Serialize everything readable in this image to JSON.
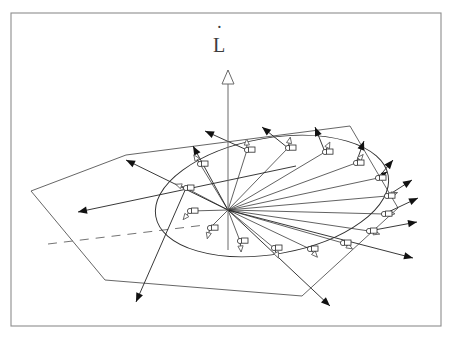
{
  "figure": {
    "title_label": "L̇",
    "axis_label_letter": "L",
    "axis_label_dot": "˙",
    "axis_name": "angular-momentum-rate-axis",
    "background_color": "#ffffff",
    "line_color": "#2f2f2f",
    "frame_color": "#8d8d8d",
    "arrow_fill_color": "#111111",
    "apex": {
      "x": 228,
      "y": 210
    },
    "frame": {
      "x": 11,
      "y": 13,
      "width": 430,
      "height": 313
    },
    "vertical_axis": {
      "x": 228,
      "y_top": 70,
      "y_bottom": 250
    },
    "plane": {
      "name": "tilted-reference-plane",
      "points": "31,191 126,155 350,126 398,208 302,296 105,280",
      "dash_from": {
        "x": 48,
        "y": 244
      },
      "dash_to": {
        "x": 205,
        "y": 225
      }
    },
    "cone_base_ellipse": {
      "center": {
        "x": 272,
        "y": 196
      },
      "rx": 118,
      "ry": 58,
      "rotation_deg": -10
    },
    "node_count": 16,
    "nodes": [
      {
        "id": 1,
        "x": 247,
        "y": 150,
        "ang": 92,
        "tip": "open"
      },
      {
        "id": 2,
        "x": 288,
        "y": 148,
        "ang": 78,
        "tip": "open"
      },
      {
        "id": 3,
        "x": 325,
        "y": 152,
        "ang": 64,
        "tip": "open"
      },
      {
        "id": 4,
        "x": 356,
        "y": 163,
        "ang": 50,
        "tip": "open"
      },
      {
        "id": 5,
        "x": 378,
        "y": 178,
        "ang": 34,
        "tip": "filled"
      },
      {
        "id": 6,
        "x": 387,
        "y": 196,
        "ang": 18,
        "tip": "open"
      },
      {
        "id": 7,
        "x": 384,
        "y": 214,
        "ang": 2,
        "tip": "open"
      },
      {
        "id": 8,
        "x": 369,
        "y": 231,
        "ang": -16,
        "tip": "open"
      },
      {
        "id": 9,
        "x": 343,
        "y": 243,
        "ang": -32,
        "tip": "open"
      },
      {
        "id": 10,
        "x": 310,
        "y": 249,
        "ang": -48,
        "tip": "open"
      },
      {
        "id": 11,
        "x": 274,
        "y": 248,
        "ang": -66,
        "tip": "open"
      },
      {
        "id": 12,
        "x": 240,
        "y": 241,
        "ang": -84,
        "tip": "open"
      },
      {
        "id": 13,
        "x": 210,
        "y": 228,
        "ang": -104,
        "tip": "open"
      },
      {
        "id": 14,
        "x": 190,
        "y": 211,
        "ang": -128,
        "tip": "open"
      },
      {
        "id": 15,
        "x": 186,
        "y": 188,
        "ang": 160,
        "tip": "open"
      },
      {
        "id": 16,
        "x": 200,
        "y": 164,
        "ang": 124,
        "tip": "open"
      }
    ],
    "outer_vectors": [
      {
        "name": "vector-up-left-long",
        "x1": 228,
        "y1": 210,
        "x2": 126,
        "y2": 160
      },
      {
        "name": "vector-upper-left",
        "x1": 228,
        "y1": 210,
        "x2": 193,
        "y2": 146
      },
      {
        "name": "vector-top-a",
        "x1": 247,
        "y1": 150,
        "x2": 205,
        "y2": 131
      },
      {
        "name": "vector-top-b",
        "x1": 288,
        "y1": 148,
        "x2": 262,
        "y2": 127
      },
      {
        "name": "vector-top-c",
        "x1": 325,
        "y1": 152,
        "x2": 315,
        "y2": 127
      },
      {
        "name": "vector-top-d",
        "x1": 356,
        "y1": 163,
        "x2": 364,
        "y2": 141
      },
      {
        "name": "vector-right-up",
        "x1": 378,
        "y1": 178,
        "x2": 393,
        "y2": 160
      },
      {
        "name": "vector-right-a",
        "x1": 387,
        "y1": 196,
        "x2": 412,
        "y2": 180
      },
      {
        "name": "vector-right-b",
        "x1": 384,
        "y1": 214,
        "x2": 418,
        "y2": 198
      },
      {
        "name": "vector-right-c",
        "x1": 369,
        "y1": 231,
        "x2": 417,
        "y2": 222
      },
      {
        "name": "vector-right-low",
        "x1": 228,
        "y1": 210,
        "x2": 413,
        "y2": 258
      },
      {
        "name": "vector-down-right",
        "x1": 228,
        "y1": 210,
        "x2": 330,
        "y2": 306
      },
      {
        "name": "vector-down-left",
        "x1": 186,
        "y1": 188,
        "x2": 136,
        "y2": 302
      },
      {
        "name": "vector-far-left",
        "x1": 296,
        "y1": 166,
        "x2": 78,
        "y2": 212
      }
    ],
    "radial_ray_count": 16
  }
}
